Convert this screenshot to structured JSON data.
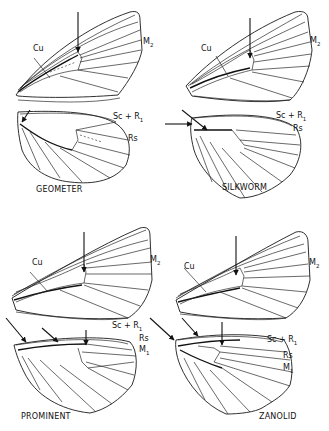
{
  "figure": {
    "panels": [
      {
        "name": "GEOMETER",
        "labels": {
          "cu": "Cu",
          "m2": "M",
          "m2_sub": "2",
          "scr1": "Sc + R",
          "scr1_sub": "1",
          "rs": "Rs"
        }
      },
      {
        "name": "SILKWORM",
        "labels": {
          "cu": "Cu",
          "m2": "M",
          "m2_sub": "2",
          "scr1": "Sc + R",
          "scr1_sub": "1",
          "rs": "Rs"
        }
      },
      {
        "name": "PROMINENT",
        "labels": {
          "cu": "Cu",
          "m2": "M",
          "m2_sub": "2",
          "scr1": "Sc + R",
          "scr1_sub": "1",
          "rs": "Rs",
          "m1": "M",
          "m1_sub": "1"
        }
      },
      {
        "name": "ZANOLID",
        "labels": {
          "cu": "Cu",
          "m2": "M",
          "m2_sub": "2",
          "scr1": "Sc + R",
          "scr1_sub": "1",
          "rs": "Rs",
          "m1": "M",
          "m1_sub": "1"
        }
      }
    ],
    "icons": [
      "arrow-icon"
    ]
  }
}
